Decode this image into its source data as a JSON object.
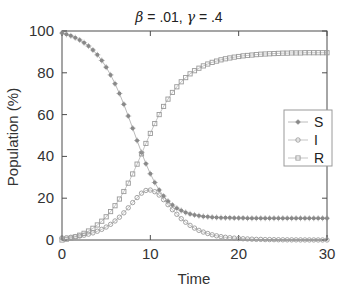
{
  "chart_data": {
    "type": "line",
    "title": "β = .01, γ = .4",
    "title_parts": {
      "beta_symbol": "β",
      "beta_text": " = .01, ",
      "gamma_symbol": "γ",
      "gamma_text": " = .4"
    },
    "xlabel": "Time",
    "ylabel": "Population (%)",
    "xlim": [
      0,
      30
    ],
    "ylim": [
      0,
      100
    ],
    "xticks": [
      0,
      10,
      20,
      30
    ],
    "yticks": [
      0,
      20,
      40,
      60,
      80,
      100
    ],
    "xticklabels": [
      "0",
      "10",
      "20",
      "30"
    ],
    "yticklabels": [
      "0",
      "20",
      "40",
      "60",
      "80",
      "100"
    ],
    "grid": false,
    "box": true,
    "legend_position": "east",
    "legend_entries": [
      "S",
      "I",
      "R"
    ],
    "x": [
      0,
      0.5,
      1,
      1.5,
      2,
      2.5,
      3,
      3.5,
      4,
      4.5,
      5,
      5.5,
      6,
      6.5,
      7,
      7.5,
      8,
      8.5,
      9,
      9.5,
      10,
      10.5,
      11,
      11.5,
      12,
      12.5,
      13,
      13.5,
      14,
      14.5,
      15,
      15.5,
      16,
      16.5,
      17,
      17.5,
      18,
      18.5,
      19,
      19.5,
      20,
      20.5,
      21,
      21.5,
      22,
      22.5,
      23,
      23.5,
      24,
      24.5,
      25,
      25.5,
      26,
      26.5,
      27,
      27.5,
      28,
      28.5,
      29,
      29.5,
      30
    ],
    "series": [
      {
        "name": "S",
        "marker": "star",
        "color": "#8a8a8a",
        "values": [
          99.0,
          98.4,
          97.7,
          96.8,
          95.7,
          94.4,
          92.8,
          90.9,
          88.6,
          85.9,
          82.7,
          79.0,
          74.8,
          70.1,
          64.9,
          59.3,
          53.5,
          47.6,
          41.9,
          36.5,
          31.7,
          27.5,
          23.9,
          21.0,
          18.6,
          16.7,
          15.2,
          14.1,
          13.2,
          12.5,
          12.0,
          11.6,
          11.3,
          11.1,
          10.9,
          10.8,
          10.7,
          10.6,
          10.6,
          10.5,
          10.5,
          10.5,
          10.4,
          10.4,
          10.4,
          10.4,
          10.4,
          10.4,
          10.4,
          10.4,
          10.4,
          10.4,
          10.4,
          10.4,
          10.4,
          10.4,
          10.4,
          10.4,
          10.4,
          10.4,
          10.4
        ]
      },
      {
        "name": "I",
        "marker": "circle",
        "color": "#9a9a9a",
        "values": [
          1.0,
          1.1,
          1.3,
          1.6,
          1.9,
          2.3,
          2.8,
          3.4,
          4.2,
          5.1,
          6.2,
          7.5,
          9.1,
          10.9,
          13.0,
          15.4,
          17.9,
          20.3,
          22.4,
          23.7,
          23.9,
          23.1,
          21.5,
          19.3,
          16.9,
          14.5,
          12.3,
          10.2,
          8.5,
          7.0,
          5.7,
          4.6,
          3.8,
          3.1,
          2.5,
          2.0,
          1.6,
          1.3,
          1.1,
          0.9,
          0.7,
          0.6,
          0.5,
          0.4,
          0.3,
          0.3,
          0.2,
          0.2,
          0.15,
          0.12,
          0.1,
          0.08,
          0.07,
          0.06,
          0.05,
          0.04,
          0.03,
          0.03,
          0.02,
          0.02,
          0.01
        ]
      },
      {
        "name": "R",
        "marker": "square",
        "color": "#9a9a9a",
        "values": [
          0.0,
          0.4,
          0.9,
          1.5,
          2.3,
          3.2,
          4.3,
          5.6,
          7.2,
          9.0,
          11.1,
          13.6,
          16.4,
          19.6,
          23.2,
          27.2,
          31.6,
          36.3,
          41.2,
          46.2,
          51.0,
          55.7,
          60.0,
          63.9,
          67.4,
          70.6,
          73.3,
          75.7,
          77.7,
          79.5,
          81.0,
          82.2,
          83.3,
          84.2,
          85.0,
          85.6,
          86.2,
          86.7,
          87.1,
          87.5,
          87.8,
          88.1,
          88.3,
          88.5,
          88.7,
          88.9,
          89.0,
          89.1,
          89.2,
          89.3,
          89.4,
          89.4,
          89.5,
          89.5,
          89.5,
          89.6,
          89.6,
          89.6,
          89.6,
          89.6,
          89.6
        ]
      }
    ]
  },
  "colors": {
    "axis": "#4d4d4d",
    "text": "#333333",
    "series_s": "#8a8a8a",
    "series_i": "#9a9a9a",
    "series_r": "#9a9a9a",
    "legend_border": "#9a9a9a",
    "background": "#ffffff"
  }
}
